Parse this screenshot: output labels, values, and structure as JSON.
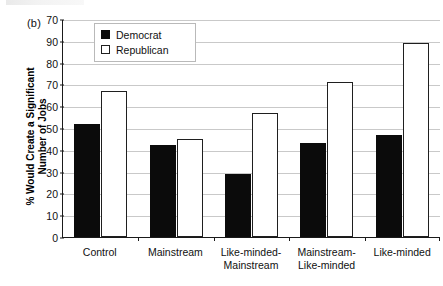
{
  "panel": {
    "label": "(b)"
  },
  "chart_data": {
    "type": "bar",
    "title": "",
    "xlabel": "",
    "ylabel": "% Would Create a Significant\nNumber of Jobs",
    "ylim": [
      0,
      100
    ],
    "yticks": [
      0,
      10,
      20,
      30,
      40,
      50,
      60,
      70,
      80,
      90,
      100
    ],
    "ytick_labels": [
      "0",
      "10",
      "20",
      "30",
      "40",
      "50",
      "60",
      "70",
      "80",
      "90",
      "70"
    ],
    "grid": true,
    "legend_position": "upper-left-inside",
    "categories": [
      "Control",
      "Mainstream",
      "Like-minded-\nMainstream",
      "Mainstream-\nLike-minded",
      "Like-minded"
    ],
    "series": [
      {
        "name": "Democrat",
        "color": "#0b0b0b",
        "fill": "solid",
        "values": [
          52,
          42,
          29,
          43,
          47
        ]
      },
      {
        "name": "Republican",
        "color": "#ffffff",
        "fill": "outline",
        "values": [
          67,
          45,
          57,
          71,
          89
        ]
      }
    ]
  },
  "legend": {
    "items": [
      {
        "label": "Democrat",
        "swatch": "filled-square-icon"
      },
      {
        "label": "Republican",
        "swatch": "outlined-square-icon"
      }
    ]
  },
  "colors": {
    "democrat": "#0b0b0b",
    "republican": "#ffffff",
    "axis": "#1a1a1a",
    "gridline": "#c9c9c9",
    "background": "#ffffff"
  }
}
